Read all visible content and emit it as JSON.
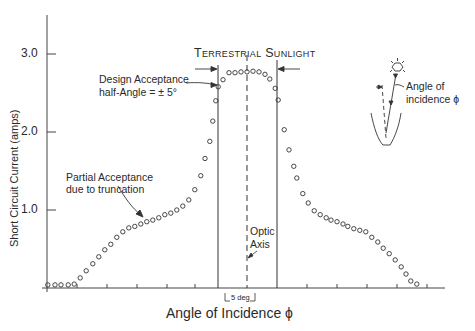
{
  "chart_data": {
    "type": "scatter",
    "title": "Terrestrial Sunlight",
    "xlabel": "Angle of Incidence ϕ",
    "ylabel": "Short Circuit Current (amps)",
    "x_units": "degrees relative to optic axis",
    "ylim": [
      0,
      3.5
    ],
    "xlim": [
      -34,
      33
    ],
    "yticks": [
      1.0,
      2.0,
      3.0
    ],
    "ytick_labels": [
      "1.0",
      "2.0",
      "3.0"
    ],
    "grid": false,
    "legend": null,
    "marker": "open-circle",
    "series": [
      {
        "name": "Measured short circuit current",
        "x": [
          -33.2,
          -32.0,
          -31.0,
          -29.8,
          -28.8,
          -27.8,
          -26.8,
          -25.7,
          -24.7,
          -23.7,
          -22.7,
          -21.7,
          -20.7,
          -19.7,
          -18.7,
          -17.7,
          -16.7,
          -15.7,
          -14.7,
          -13.7,
          -12.7,
          -11.7,
          -10.7,
          -9.7,
          -8.7,
          -7.7,
          -7.0,
          -6.2,
          -5.7,
          -5.2,
          -4.8,
          -4.0,
          -3.0,
          -2.0,
          -1.0,
          0.0,
          1.0,
          2.0,
          3.0,
          3.8,
          4.7,
          5.2,
          6.2,
          7.0,
          7.8,
          8.3,
          9.3,
          10.2,
          11.2,
          12.2,
          13.2,
          14.0,
          15.0,
          16.0,
          16.8,
          17.8,
          18.8,
          19.8,
          20.8,
          21.8,
          22.7,
          23.7,
          24.7,
          25.7,
          26.5,
          27.3,
          28.3
        ],
        "y": [
          0.04,
          0.04,
          0.04,
          0.04,
          0.05,
          0.13,
          0.22,
          0.31,
          0.4,
          0.49,
          0.56,
          0.65,
          0.72,
          0.77,
          0.79,
          0.82,
          0.85,
          0.87,
          0.9,
          0.94,
          0.96,
          1.0,
          1.05,
          1.13,
          1.26,
          1.44,
          1.66,
          1.88,
          2.14,
          2.4,
          2.58,
          2.67,
          2.76,
          2.76,
          2.77,
          2.77,
          2.78,
          2.77,
          2.74,
          2.68,
          2.56,
          2.41,
          2.03,
          1.77,
          1.56,
          1.41,
          1.21,
          1.09,
          0.99,
          0.94,
          0.9,
          0.87,
          0.85,
          0.82,
          0.79,
          0.76,
          0.74,
          0.72,
          0.65,
          0.59,
          0.51,
          0.44,
          0.36,
          0.27,
          0.18,
          0.09,
          0.05
        ]
      }
    ],
    "reference_lines": [
      {
        "name": "Optic Axis",
        "x": 0,
        "style": "dashed"
      },
      {
        "name": "Design acceptance lower bound",
        "x": -5,
        "style": "solid"
      },
      {
        "name": "Design acceptance upper bound",
        "x": 5,
        "style": "solid"
      }
    ],
    "annotations": [
      {
        "text": "Design Acceptance half-Angle = ± 5°",
        "points_to": "x=-5 boundary"
      },
      {
        "text": "Partial Acceptance due to truncation",
        "points_to": "left shoulder near x=-13"
      },
      {
        "text": "Optic Axis",
        "points_to": "x=0 dashed line"
      },
      {
        "text": "5 deg",
        "points_to": "scale bar between x=-4 and x=+1"
      },
      {
        "text": "Angle of incidence ϕ",
        "points_to": "inset concentrator diagram"
      }
    ]
  },
  "labels": {
    "title_main": "Terrestrial Sunlight",
    "ytick_3": "3.0",
    "ytick_2": "2.0",
    "ytick_1": "1.0",
    "ylabel": "Short Circuit Current (amps)",
    "xlabel": "Angle of Incidence ϕ",
    "design_line1": "Design Acceptance",
    "design_line2": "half-Angle = ± 5°",
    "partial_line1": "Partial Acceptance",
    "partial_line2": "due to truncation",
    "optic_line1": "Optic",
    "optic_line2": "Axis",
    "scale_bar": "5 deg",
    "inset_line1": "Angle of",
    "inset_line2": "incidence ϕ"
  },
  "colors": {
    "ink": "#333333",
    "background": "#ffffff"
  }
}
